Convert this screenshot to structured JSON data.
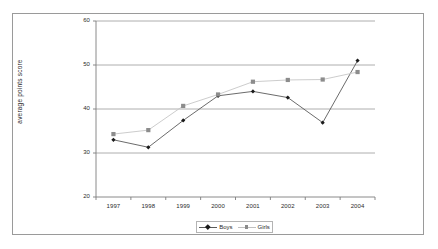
{
  "chart_data": {
    "type": "line",
    "title": "",
    "xlabel": "",
    "ylabel": "average points score",
    "categories": [
      "1997",
      "1998",
      "1999",
      "2000",
      "2001",
      "2002",
      "2003",
      "2004"
    ],
    "series": [
      {
        "name": "Boys",
        "marker": "diamond",
        "color": "#1a1a1a",
        "line_color": "#5a5a5a",
        "values": [
          33,
          31.3,
          37.4,
          43,
          44,
          42.6,
          36.9,
          51
        ]
      },
      {
        "name": "Girls",
        "marker": "square",
        "color": "#8c8c8c",
        "line_color": "#c6c6c6",
        "values": [
          34.3,
          35.2,
          40.7,
          43.3,
          46.2,
          46.6,
          46.7,
          48.4
        ]
      }
    ],
    "ylim": [
      20,
      60
    ],
    "y_ticks": [
      "20",
      "30",
      "40",
      "50",
      "60"
    ],
    "grid": "horizontal",
    "legend_position": "bottom"
  },
  "axis": {
    "y_title": "average points score",
    "y_tick_labels": [
      "60",
      "50",
      "40",
      "30",
      "20"
    ],
    "x_tick_labels": [
      "1997",
      "1998",
      "1999",
      "2000",
      "2001",
      "2002",
      "2003",
      "2004"
    ]
  },
  "legend": {
    "entries": [
      {
        "label": "Boys"
      },
      {
        "label": "Girls"
      }
    ]
  },
  "colors": {
    "frame": "#9a9a9a",
    "gridline": "#9b9b9b",
    "axis": "#7d7d7d",
    "boys_marker": "#1a1a1a",
    "boys_line": "#5a5a5a",
    "girls_marker": "#8c8c8c",
    "girls_line": "#c6c6c6",
    "text": "#2b2b2b",
    "background": "#ffffff"
  }
}
